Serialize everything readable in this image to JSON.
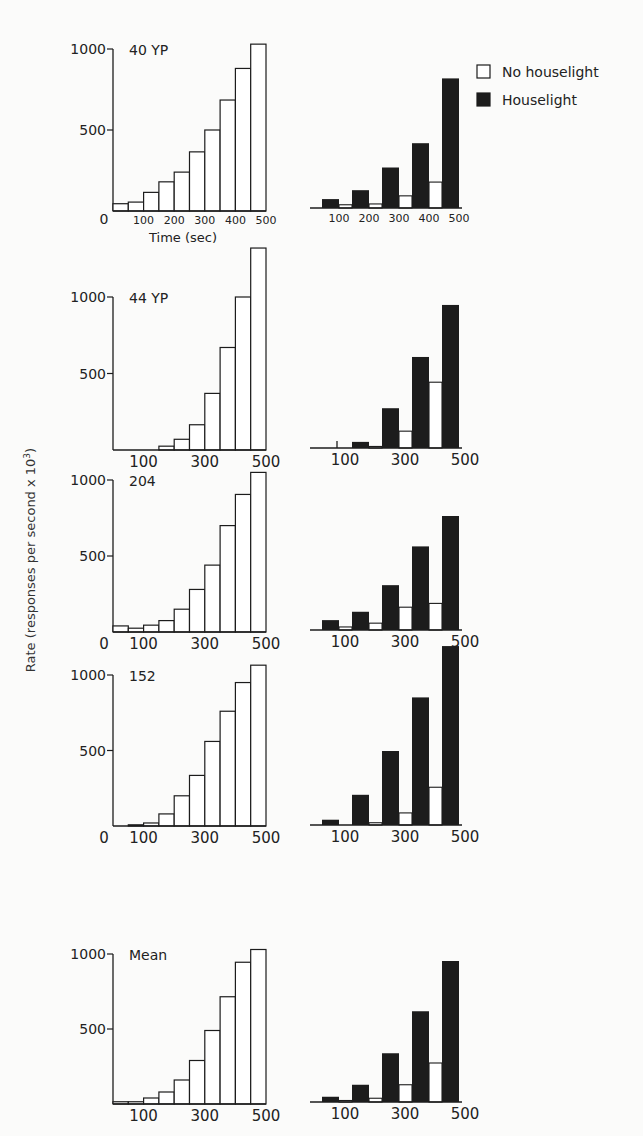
{
  "figure": {
    "y_axis_label": "Rate (responses per second x 10",
    "y_axis_label_exp": "3",
    "y_axis_label_close": ")",
    "legend": [
      {
        "label": "No houselight",
        "fill": "#ffffff"
      },
      {
        "label": "Houselight",
        "fill": "#1c1c1c"
      }
    ]
  },
  "chart_data": [
    {
      "type": "bar",
      "panel": "left",
      "title": "40 YP",
      "xlabel": "Time (sec)",
      "ylabel": "Rate (responses per second x 10^3)",
      "x_ticks": [
        "0",
        "100",
        "200",
        "300",
        "400",
        "500"
      ],
      "y_ticks": [
        500,
        1000
      ],
      "ylim": [
        0,
        1000
      ],
      "bin_width_sec": 50,
      "categories": [
        25,
        75,
        125,
        175,
        225,
        275,
        325,
        375,
        425,
        475
      ],
      "values": [
        45,
        55,
        115,
        180,
        240,
        365,
        500,
        685,
        880,
        1030
      ]
    },
    {
      "type": "bar",
      "panel": "right",
      "title": "40 YP",
      "x_ticks": [
        "100",
        "200",
        "300",
        "400",
        "500"
      ],
      "series": [
        {
          "name": "Houselight",
          "values": [
            55,
            110,
            250,
            400,
            800
          ]
        },
        {
          "name": "No houselight",
          "values": [
            20,
            25,
            75,
            160
          ]
        }
      ]
    },
    {
      "type": "bar",
      "panel": "left",
      "title": "44 YP",
      "x_ticks": [
        "100",
        "300",
        "500"
      ],
      "y_ticks": [
        500,
        1000
      ],
      "categories": [
        25,
        75,
        125,
        175,
        225,
        275,
        325,
        375,
        425,
        475
      ],
      "values": [
        0,
        0,
        0,
        25,
        70,
        165,
        370,
        670,
        1000,
        1320
      ]
    },
    {
      "type": "bar",
      "panel": "right",
      "title": "44 YP",
      "x_ticks": [
        "100",
        "300",
        "500"
      ],
      "series": [
        {
          "name": "Houselight",
          "values": [
            0,
            40,
            260,
            595,
            935
          ]
        },
        {
          "name": "No houselight",
          "values": [
            0,
            10,
            110,
            430
          ]
        }
      ]
    },
    {
      "type": "bar",
      "panel": "left",
      "title": "204",
      "x_ticks": [
        "0",
        "100",
        "300",
        "500"
      ],
      "y_ticks": [
        500,
        1000
      ],
      "categories": [
        25,
        75,
        125,
        175,
        225,
        275,
        325,
        375,
        425,
        475
      ],
      "values": [
        40,
        25,
        45,
        75,
        150,
        280,
        440,
        700,
        905,
        1050
      ]
    },
    {
      "type": "bar",
      "panel": "right",
      "title": "204",
      "x_ticks": [
        "100",
        "300",
        "500"
      ],
      "series": [
        {
          "name": "Houselight",
          "values": [
            65,
            120,
            295,
            550,
            750
          ]
        },
        {
          "name": "No houselight",
          "values": [
            20,
            45,
            150,
            175
          ]
        }
      ]
    },
    {
      "type": "bar",
      "panel": "left",
      "title": "152",
      "x_ticks": [
        "0",
        "100",
        "300",
        "500"
      ],
      "y_ticks": [
        500,
        1000
      ],
      "categories": [
        25,
        75,
        125,
        175,
        225,
        275,
        325,
        375,
        425,
        475
      ],
      "values": [
        0,
        8,
        20,
        80,
        200,
        335,
        560,
        760,
        950,
        1065
      ]
    },
    {
      "type": "bar",
      "panel": "right",
      "title": "152",
      "x_ticks": [
        "100",
        "300",
        "500"
      ],
      "series": [
        {
          "name": "Houselight",
          "values": [
            35,
            200,
            490,
            845,
            1185
          ]
        },
        {
          "name": "No houselight",
          "values": [
            0,
            15,
            80,
            250
          ]
        }
      ]
    },
    {
      "type": "bar",
      "panel": "left",
      "title": "Mean",
      "x_ticks": [
        "100",
        "300",
        "500"
      ],
      "y_ticks": [
        500,
        1000
      ],
      "categories": [
        25,
        75,
        125,
        175,
        225,
        275,
        325,
        375,
        425,
        475
      ],
      "values": [
        15,
        15,
        40,
        80,
        160,
        290,
        490,
        715,
        945,
        1030
      ]
    },
    {
      "type": "bar",
      "panel": "right",
      "title": "Mean",
      "x_ticks": [
        "100",
        "300",
        "500"
      ],
      "series": [
        {
          "name": "Houselight",
          "values": [
            35,
            115,
            325,
            605,
            940
          ]
        },
        {
          "name": "No houselight",
          "values": [
            10,
            25,
            115,
            260
          ]
        }
      ]
    }
  ]
}
